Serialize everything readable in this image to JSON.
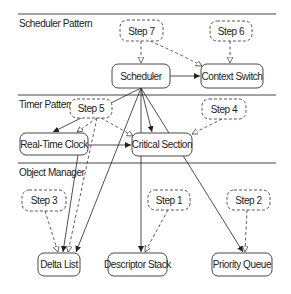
{
  "diagram": {
    "lanes": [
      {
        "id": "scheduler-pattern",
        "label": "Scheduler Pattern",
        "y": 14
      },
      {
        "id": "timer-pattern",
        "label": "Timer Pattern",
        "y": 95
      },
      {
        "id": "object-manager",
        "label": "Object Manager",
        "y": 163
      }
    ],
    "nodes": {
      "scheduler": {
        "label": "Scheduler"
      },
      "context_switch": {
        "label": "Context Switch"
      },
      "real_time_clock": {
        "label": "Real-Time Clock"
      },
      "critical_section": {
        "label": "Critical Section"
      },
      "delta_list": {
        "label": "Delta List"
      },
      "descriptor_stack": {
        "label": "Descriptor Stack"
      },
      "priority_queue": {
        "label": "Priority Queue"
      }
    },
    "steps": {
      "step1": {
        "label": "Step 1"
      },
      "step2": {
        "label": "Step 2"
      },
      "step3": {
        "label": "Step 3"
      },
      "step4": {
        "label": "Step 4"
      },
      "step5": {
        "label": "Step 5"
      },
      "step6": {
        "label": "Step 6"
      },
      "step7": {
        "label": "Step 7"
      }
    },
    "edges": [
      {
        "from": "Scheduler",
        "to": "Context Switch",
        "style": "solid"
      },
      {
        "from": "Scheduler",
        "to": "Real-Time Clock",
        "style": "solid"
      },
      {
        "from": "Scheduler",
        "to": "Critical Section",
        "style": "solid"
      },
      {
        "from": "Scheduler",
        "to": "Delta List",
        "style": "solid"
      },
      {
        "from": "Scheduler",
        "to": "Descriptor Stack",
        "style": "solid"
      },
      {
        "from": "Scheduler",
        "to": "Priority Queue",
        "style": "solid"
      },
      {
        "from": "Real-Time Clock",
        "to": "Critical Section",
        "style": "solid"
      },
      {
        "from": "Real-Time Clock",
        "to": "Delta List",
        "style": "solid"
      },
      {
        "from": "Step 7",
        "to": "Scheduler",
        "style": "dashed"
      },
      {
        "from": "Step 7",
        "to": "Context Switch",
        "style": "dashed"
      },
      {
        "from": "Step 6",
        "to": "Context Switch",
        "style": "dashed"
      },
      {
        "from": "Step 5",
        "to": "Real-Time Clock",
        "style": "dashed"
      },
      {
        "from": "Step 5",
        "to": "Critical Section",
        "style": "dashed"
      },
      {
        "from": "Step 5",
        "to": "Delta List",
        "style": "dashed"
      },
      {
        "from": "Step 4",
        "to": "Critical Section",
        "style": "dashed"
      },
      {
        "from": "Step 3",
        "to": "Delta List",
        "style": "dashed"
      },
      {
        "from": "Step 1",
        "to": "Descriptor Stack",
        "style": "dashed"
      },
      {
        "from": "Step 2",
        "to": "Priority Queue",
        "style": "dashed"
      }
    ]
  }
}
